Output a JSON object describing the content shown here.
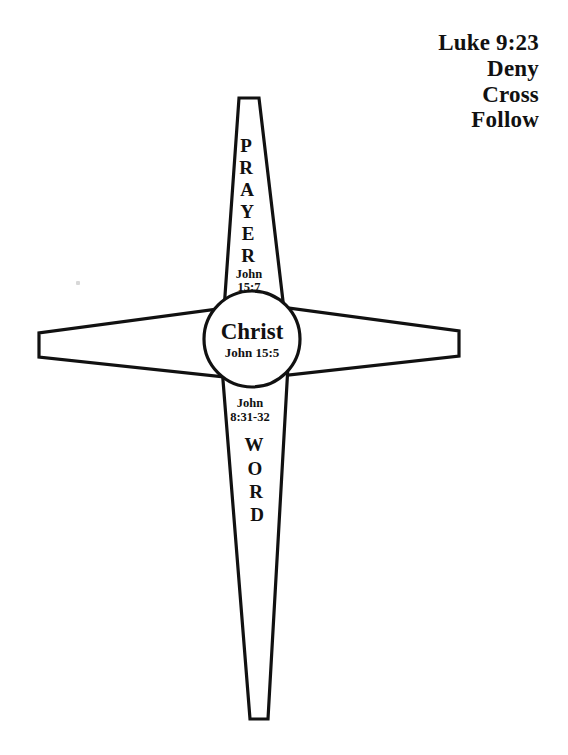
{
  "page": {
    "background_color": "#ffffff",
    "ink_color": "#111111",
    "width": 568,
    "height": 755
  },
  "header": {
    "lines": [
      "Luke 9:23",
      "Deny",
      "Cross",
      "Follow"
    ]
  },
  "diagram": {
    "top_beam": {
      "label": "PRAYER",
      "letters": [
        "P",
        "R",
        "A",
        "Y",
        "E",
        "R"
      ],
      "reference_line1": "John",
      "reference_line2": "15:7"
    },
    "center": {
      "name": "Christ",
      "reference": "John 15:5"
    },
    "bottom_beam": {
      "label": "WORD",
      "letters": [
        "W",
        "O",
        "R",
        "D"
      ],
      "reference_line1": "John",
      "reference_line2": "8:31-32"
    },
    "left_arm": {
      "label": ""
    },
    "right_arm": {
      "label": ""
    }
  }
}
